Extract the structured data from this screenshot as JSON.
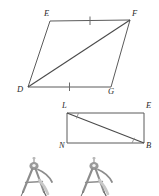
{
  "figures": {
    "parallelogram": {
      "name": "parallelogram-defg",
      "vertices": [
        {
          "id": "E",
          "label": "E",
          "x": 50,
          "y": 21
        },
        {
          "id": "F",
          "label": "F",
          "x": 130,
          "y": 20
        },
        {
          "id": "D",
          "label": "D",
          "x": 28,
          "y": 87
        },
        {
          "id": "G",
          "label": "G",
          "x": 111,
          "y": 87
        }
      ],
      "labels": {
        "E": "E",
        "F": "F",
        "D": "D",
        "G": "G"
      },
      "diagonal": "DF",
      "tick_marks": [
        "EF",
        "DG"
      ],
      "tick_count": 1
    },
    "rectangle": {
      "name": "rectangle-lenb",
      "vertices": [
        {
          "id": "L",
          "label": "L",
          "x": 67,
          "y": 113
        },
        {
          "id": "E",
          "label": "E",
          "x": 144,
          "y": 113
        },
        {
          "id": "N",
          "label": "N",
          "x": 67,
          "y": 143
        },
        {
          "id": "B",
          "label": "B",
          "x": 144,
          "y": 143
        }
      ],
      "labels": {
        "L": "L",
        "E": "E",
        "N": "N",
        "B": "B"
      },
      "diagonal": "LB",
      "angle_marks": [
        "L",
        "B"
      ]
    },
    "compasses": [
      {
        "name": "compass-left",
        "x": 13,
        "y": 156
      },
      {
        "name": "compass-right",
        "x": 73,
        "y": 156
      }
    ]
  },
  "colors": {
    "background": "#ffffff",
    "line": "#5b5b5b",
    "label": "#2a2a2a",
    "angle_mark": "#8a8a8a",
    "compass_metal": "#8d8d8d"
  }
}
